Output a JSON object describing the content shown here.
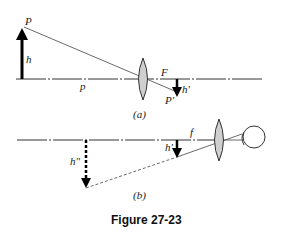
{
  "figure": {
    "caption": "Figure 27-23",
    "panel_a": {
      "label": "(a)",
      "object_top_label": "P",
      "object_height_label": "h",
      "object_distance_label": "p",
      "focal_label": "F",
      "image_height_label": "h′",
      "image_tip_label": "P′"
    },
    "panel_b": {
      "label": "(b)",
      "virtual_image_label": "h″",
      "focal_label": "f",
      "object_height_label": "h′"
    }
  },
  "colors": {
    "line": "#333333",
    "lens_fill": "#cfcfcf",
    "arrow": "#000000"
  }
}
